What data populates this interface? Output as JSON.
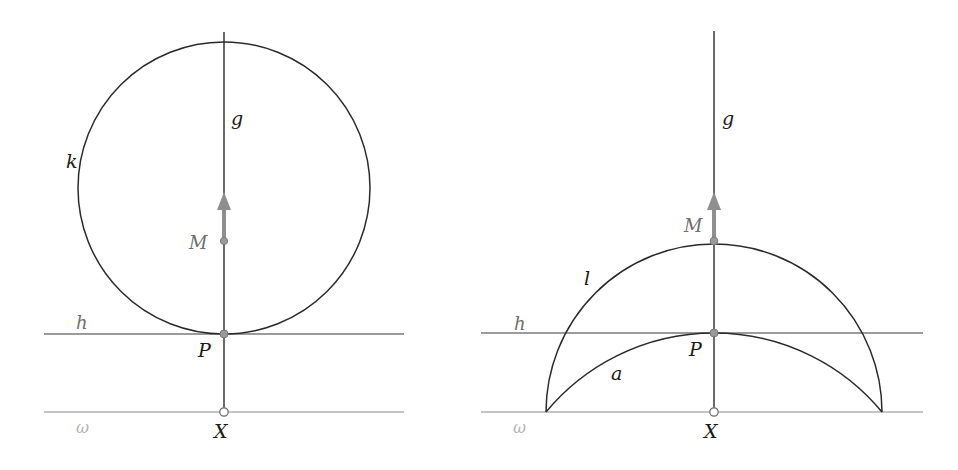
{
  "colors": {
    "curve": "#2a2a2a",
    "line_h": "#7a7a7a",
    "line_omega": "#b0b0b0",
    "point_fill": "#9a9a9a",
    "arrow": "#8f8f8f",
    "label_dark": "#1a1a1a",
    "label_gray": "#6e6e6e",
    "label_light": "#b4b4b4"
  },
  "left_figure": {
    "labels": {
      "line_g": "g",
      "circle_k": "k",
      "point_M": "M",
      "line_h": "h",
      "point_P": "P",
      "line_omega": "ω",
      "point_X": "X"
    }
  },
  "right_figure": {
    "labels": {
      "line_g": "g",
      "point_M": "M",
      "arc_l": "l",
      "line_h": "h",
      "point_P": "P",
      "arc_a": "a",
      "line_omega": "ω",
      "point_X": "X"
    }
  }
}
